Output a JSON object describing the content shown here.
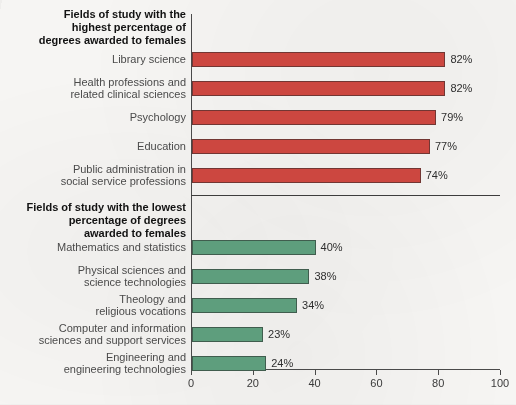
{
  "chart_data": {
    "type": "bar",
    "orientation": "horizontal",
    "title": "",
    "xlabel": "",
    "ylabel": "",
    "xlim": [
      0,
      100
    ],
    "xticks": [
      0,
      20,
      40,
      60,
      80,
      100
    ],
    "grid": false,
    "legend": null,
    "value_suffix": "%",
    "groups": [
      {
        "header": "Fields of study with the highest percentage of degrees awarded to females",
        "header_lines": [
          "Fields of study with the",
          "highest percentage of",
          "degrees awarded to females"
        ],
        "color": "#cc4740",
        "categories": [
          "Library science",
          "Health professions and related clinical sciences",
          "Psychology",
          "Education",
          "Public administration in social service professions"
        ],
        "category_lines": [
          [
            "Library science"
          ],
          [
            "Health professions and",
            "related clinical sciences"
          ],
          [
            "Psychology"
          ],
          [
            "Education"
          ],
          [
            "Public administration in",
            "social service professions"
          ]
        ],
        "values": [
          82,
          82,
          79,
          77,
          74
        ],
        "value_labels": [
          "82%",
          "82%",
          "79%",
          "77%",
          "74%"
        ]
      },
      {
        "header": "Fields of study with the lowest percentage of degrees awarded to females",
        "header_lines": [
          "Fields of study with the lowest",
          "percentage of degrees",
          "awarded to females"
        ],
        "color": "#5e9e7d",
        "categories": [
          "Mathematics and statistics",
          "Physical sciences and science technologies",
          "Theology and religious vocations",
          "Computer and information sciences and support services",
          "Engineering and engineering technologies"
        ],
        "category_lines": [
          [
            "Mathematics and statistics"
          ],
          [
            "Physical sciences and",
            "science technologies"
          ],
          [
            "Theology and",
            "religious vocations"
          ],
          [
            "Computer and information",
            "sciences and support services"
          ],
          [
            "Engineering and",
            "engineering technologies"
          ]
        ],
        "values": [
          40,
          38,
          34,
          23,
          24
        ],
        "value_labels": [
          "40%",
          "38%",
          "34%",
          "23%",
          "24%"
        ]
      }
    ]
  },
  "colors": {
    "high_group_bar": "#cc4740",
    "low_group_bar": "#5e9e7d",
    "axis": "#4a4a4a",
    "label_text": "#4a4a4a",
    "header_text": "#121212",
    "background": "#f6f5f3"
  }
}
